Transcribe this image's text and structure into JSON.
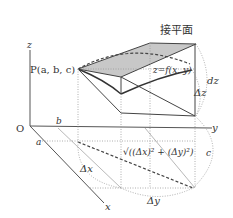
{
  "diagram": {
    "title": "接平面",
    "axes": {
      "x": "x",
      "y": "y",
      "z": "z",
      "origin": "O"
    },
    "point_label": "P(a, b, c)",
    "surface_label": "z=f(x, y)",
    "labels": {
      "a": "a",
      "b": "b",
      "c": "c",
      "dz": "dz",
      "delta_z": "Δz",
      "delta_x": "Δx",
      "delta_y": "Δy",
      "distance": "√((Δx)² + (Δy)²)"
    },
    "colors": {
      "tangent_plane_fill": "#c8c8c8",
      "line": "#444444",
      "dotted": "#999999"
    }
  }
}
